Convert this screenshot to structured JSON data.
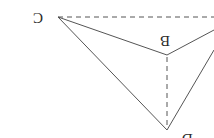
{
  "figure": {
    "orientation": "rotated 180 degrees",
    "stroke_color": "#555555",
    "labels": {
      "c": "C",
      "b": "B",
      "d": "D"
    },
    "vertices": {
      "C": [
        58,
        17
      ],
      "B": [
        167,
        55
      ],
      "D": [
        167,
        130
      ],
      "right_top": [
        214,
        17
      ],
      "right_mid": [
        214,
        30
      ]
    },
    "edges": [
      {
        "from": "C",
        "to": "B",
        "style": "solid"
      },
      {
        "from": "C",
        "to": "D",
        "style": "solid"
      },
      {
        "from": "B",
        "to": "right_mid",
        "style": "solid"
      },
      {
        "from": "D",
        "to": "right_edge",
        "style": "solid"
      },
      {
        "from": "C",
        "to": "right_top",
        "style": "dashed"
      },
      {
        "from": "B",
        "to": "D",
        "style": "dashed"
      }
    ]
  }
}
